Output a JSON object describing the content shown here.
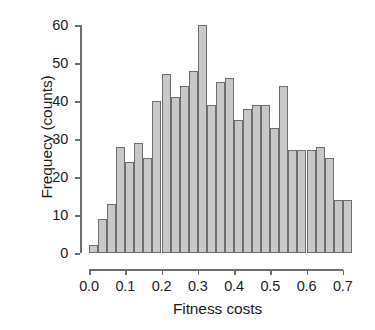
{
  "chart_data": {
    "type": "bar",
    "title": "",
    "subtitle": "",
    "xlabel": "Fitness costs",
    "ylabel": "Frequecy (counts)",
    "xlim": [
      0.0,
      0.725
    ],
    "ylim": [
      0,
      60
    ],
    "grid": false,
    "legend": null,
    "bin_width": 0.025,
    "xtick_labels": [
      "0.0",
      "0.1",
      "0.2",
      "0.3",
      "0.4",
      "0.5",
      "0.6",
      "0.7"
    ],
    "xtick_values": [
      0.0,
      0.1,
      0.2,
      0.3,
      0.4,
      0.5,
      0.6,
      0.7
    ],
    "ytick_labels": [
      "0",
      "10",
      "20",
      "30",
      "40",
      "50",
      "60"
    ],
    "ytick_values": [
      0,
      10,
      20,
      30,
      40,
      50,
      60
    ],
    "bin_left_edges": [
      0.0,
      0.025,
      0.05,
      0.075,
      0.1,
      0.125,
      0.15,
      0.175,
      0.2,
      0.225,
      0.25,
      0.275,
      0.3,
      0.325,
      0.35,
      0.375,
      0.4,
      0.425,
      0.45,
      0.475,
      0.5,
      0.525,
      0.55,
      0.575,
      0.6,
      0.625,
      0.65,
      0.675,
      0.7
    ],
    "values": [
      2,
      9,
      13,
      28,
      24,
      29,
      25,
      40,
      47,
      41,
      44,
      48,
      60,
      39,
      45,
      46,
      35,
      38,
      39,
      39,
      33,
      44,
      27,
      27,
      27,
      28,
      25,
      14,
      14
    ],
    "bar_fill_color": "#c8c8c8",
    "bar_border_color": "#6e6e6e",
    "axis_color": "#6e6e6e",
    "text_color": "#1d1d1d",
    "background_color": "#ffffff"
  },
  "figure": {
    "width": 375,
    "height": 330
  }
}
